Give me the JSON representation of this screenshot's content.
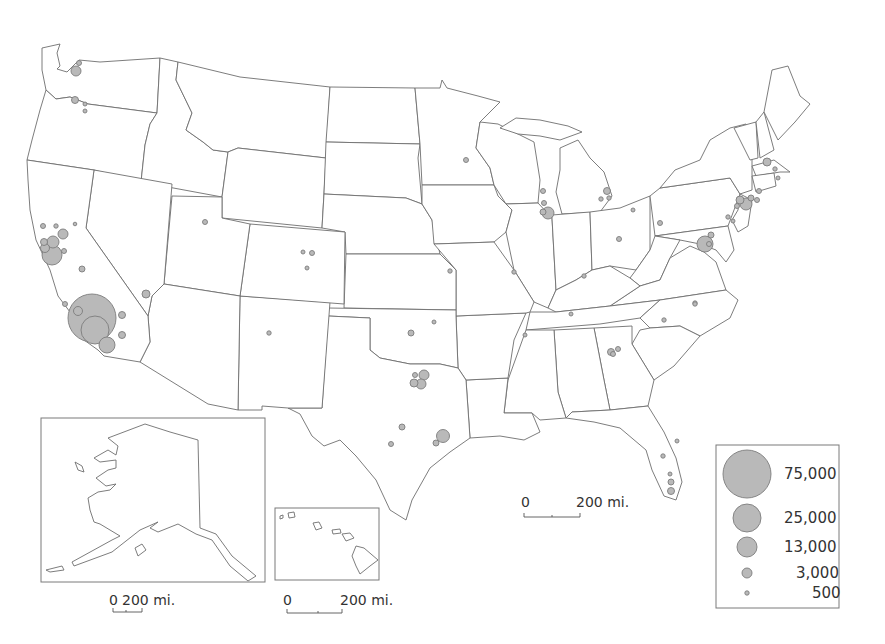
{
  "map": {
    "title": "",
    "type": "proportional-symbol-map",
    "region": "United States",
    "symbol_color": "#b9b9b9",
    "symbol_stroke": "#7d7d7d",
    "boundary_color": "#6e6e6e"
  },
  "legend": {
    "items": [
      {
        "label": "75,000",
        "r": 24
      },
      {
        "label": "25,000",
        "r": 14
      },
      {
        "label": "13,000",
        "r": 10
      },
      {
        "label": "3,000",
        "r": 5
      },
      {
        "label": "500",
        "r": 2.2
      }
    ]
  },
  "scale_bars": {
    "main": {
      "zero": "0",
      "distance": "200 mi."
    },
    "alaska": {
      "zero": "0",
      "distance": "200 mi."
    },
    "hawaii": {
      "zero": "0",
      "distance": "200 mi."
    }
  },
  "insets": {
    "alaska": {
      "name": "Alaska"
    },
    "hawaii": {
      "name": "Hawaii"
    }
  },
  "symbols": [
    {
      "name": "Los Angeles",
      "x": 92,
      "y": 318,
      "r": 24
    },
    {
      "name": "LA-secondary",
      "x": 95,
      "y": 330,
      "r": 14
    },
    {
      "name": "San Diego",
      "x": 107,
      "y": 345,
      "r": 8
    },
    {
      "name": "LA-small-1",
      "x": 78,
      "y": 311,
      "r": 4.5
    },
    {
      "name": "LA-small-2",
      "x": 122,
      "y": 315,
      "r": 3.5
    },
    {
      "name": "LA-small-3",
      "x": 122,
      "y": 335,
      "r": 3.5
    },
    {
      "name": "Santa Barbara",
      "x": 65,
      "y": 304,
      "r": 2.5
    },
    {
      "name": "Bay Area",
      "x": 52,
      "y": 255,
      "r": 10
    },
    {
      "name": "SF",
      "x": 53,
      "y": 242,
      "r": 6
    },
    {
      "name": "Oakland",
      "x": 45,
      "y": 248,
      "r": 4.5
    },
    {
      "name": "SJ-small",
      "x": 44,
      "y": 242,
      "r": 3.5
    },
    {
      "name": "Sacramento",
      "x": 63,
      "y": 234,
      "r": 5
    },
    {
      "name": "Santa Rosa",
      "x": 43,
      "y": 226,
      "r": 2.5
    },
    {
      "name": "Davis",
      "x": 56,
      "y": 226,
      "r": 2.2
    },
    {
      "name": "Chico",
      "x": 75,
      "y": 224,
      "r": 1.8
    },
    {
      "name": "CA-east",
      "x": 64,
      "y": 251,
      "r": 2.5
    },
    {
      "name": "Fresno",
      "x": 82,
      "y": 269,
      "r": 3
    },
    {
      "name": "Las Vegas",
      "x": 146,
      "y": 294,
      "r": 4
    },
    {
      "name": "Seattle",
      "x": 76,
      "y": 71,
      "r": 5
    },
    {
      "name": "Bellevue",
      "x": 79,
      "y": 63,
      "r": 2.5
    },
    {
      "name": "Portland",
      "x": 75,
      "y": 100,
      "r": 3.5
    },
    {
      "name": "Portland-2",
      "x": 85,
      "y": 104,
      "r": 2
    },
    {
      "name": "Salem",
      "x": 85,
      "y": 111,
      "r": 2
    },
    {
      "name": "Salt Lake City",
      "x": 205,
      "y": 222,
      "r": 2.5
    },
    {
      "name": "Denver",
      "x": 312,
      "y": 253,
      "r": 2.5
    },
    {
      "name": "Boulder",
      "x": 303,
      "y": 252,
      "r": 2
    },
    {
      "name": "Colorado Springs",
      "x": 307,
      "y": 268,
      "r": 2
    },
    {
      "name": "Albuquerque",
      "x": 269,
      "y": 333,
      "r": 2.2
    },
    {
      "name": "Minneapolis",
      "x": 466,
      "y": 160,
      "r": 2.5
    },
    {
      "name": "Chicago",
      "x": 548,
      "y": 213,
      "r": 6
    },
    {
      "name": "Chicago-2",
      "x": 543,
      "y": 212,
      "r": 3
    },
    {
      "name": "Milwaukee",
      "x": 543,
      "y": 191,
      "r": 2.5
    },
    {
      "name": "Chicago-north",
      "x": 544,
      "y": 203,
      "r": 2.5
    },
    {
      "name": "Detroit",
      "x": 607,
      "y": 191,
      "r": 3.5
    },
    {
      "name": "Ann Arbor",
      "x": 601,
      "y": 199,
      "r": 2.2
    },
    {
      "name": "Detroit-2",
      "x": 609,
      "y": 198,
      "r": 2.2
    },
    {
      "name": "Kansas City",
      "x": 450,
      "y": 271,
      "r": 2.2
    },
    {
      "name": "St. Louis",
      "x": 514,
      "y": 272,
      "r": 2.2
    },
    {
      "name": "Louisville",
      "x": 584,
      "y": 276,
      "r": 2.2
    },
    {
      "name": "Columbus",
      "x": 619,
      "y": 239,
      "r": 2.5
    },
    {
      "name": "Pittsburgh",
      "x": 660,
      "y": 223,
      "r": 2.5
    },
    {
      "name": "Cincinnati",
      "x": 633,
      "y": 210,
      "r": 2
    },
    {
      "name": "Boston",
      "x": 767,
      "y": 162,
      "r": 4
    },
    {
      "name": "Boston-2",
      "x": 775,
      "y": 169,
      "r": 2.2
    },
    {
      "name": "Providence",
      "x": 778,
      "y": 178,
      "r": 2
    },
    {
      "name": "NYC",
      "x": 746,
      "y": 204,
      "r": 6
    },
    {
      "name": "NYC-2",
      "x": 740,
      "y": 200,
      "r": 4
    },
    {
      "name": "NYC-3",
      "x": 751,
      "y": 198,
      "r": 3
    },
    {
      "name": "NYC-4",
      "x": 737,
      "y": 206,
      "r": 2.5
    },
    {
      "name": "CT",
      "x": 759,
      "y": 191,
      "r": 2.5
    },
    {
      "name": "Long Island",
      "x": 757,
      "y": 200,
      "r": 2.5
    },
    {
      "name": "Philadelphia",
      "x": 728,
      "y": 217,
      "r": 2.2
    },
    {
      "name": "NJ",
      "x": 733,
      "y": 221,
      "r": 2
    },
    {
      "name": "Washington DC",
      "x": 705,
      "y": 244,
      "r": 8
    },
    {
      "name": "Baltimore",
      "x": 711,
      "y": 235,
      "r": 3
    },
    {
      "name": "DC-2",
      "x": 709,
      "y": 244,
      "r": 2.5
    },
    {
      "name": "Richmond",
      "x": 695,
      "y": 303,
      "r": 2.2
    },
    {
      "name": "Raleigh",
      "x": 695,
      "y": 304,
      "r": 2.2
    },
    {
      "name": "Charlotte",
      "x": 664,
      "y": 320,
      "r": 2.2
    },
    {
      "name": "Nashville",
      "x": 571,
      "y": 314,
      "r": 2
    },
    {
      "name": "Memphis",
      "x": 525,
      "y": 335,
      "r": 2
    },
    {
      "name": "Atlanta",
      "x": 611,
      "y": 352,
      "r": 3.5
    },
    {
      "name": "Atlanta-2",
      "x": 618,
      "y": 349,
      "r": 2.5
    },
    {
      "name": "Atlanta-3",
      "x": 613,
      "y": 354,
      "r": 2.5
    },
    {
      "name": "Oklahoma City",
      "x": 411,
      "y": 333,
      "r": 3
    },
    {
      "name": "Tulsa",
      "x": 434,
      "y": 322,
      "r": 2
    },
    {
      "name": "Dallas",
      "x": 424,
      "y": 375,
      "r": 5
    },
    {
      "name": "Fort Worth",
      "x": 414,
      "y": 383,
      "r": 4
    },
    {
      "name": "Dallas-2",
      "x": 421,
      "y": 384,
      "r": 5
    },
    {
      "name": "Dallas-3",
      "x": 415,
      "y": 375,
      "r": 2.5
    },
    {
      "name": "Austin",
      "x": 402,
      "y": 427,
      "r": 3
    },
    {
      "name": "San Antonio",
      "x": 391,
      "y": 444,
      "r": 2.5
    },
    {
      "name": "Houston",
      "x": 443,
      "y": 436,
      "r": 6.5
    },
    {
      "name": "Houston-2",
      "x": 436,
      "y": 443,
      "r": 3
    },
    {
      "name": "Orlando",
      "x": 677,
      "y": 441,
      "r": 2
    },
    {
      "name": "Tampa",
      "x": 663,
      "y": 456,
      "r": 2.2
    },
    {
      "name": "West Palm",
      "x": 670,
      "y": 474,
      "r": 2
    },
    {
      "name": "Fort Lauderdale",
      "x": 671,
      "y": 482,
      "r": 3
    },
    {
      "name": "Miami",
      "x": 671,
      "y": 491,
      "r": 3.5
    }
  ]
}
